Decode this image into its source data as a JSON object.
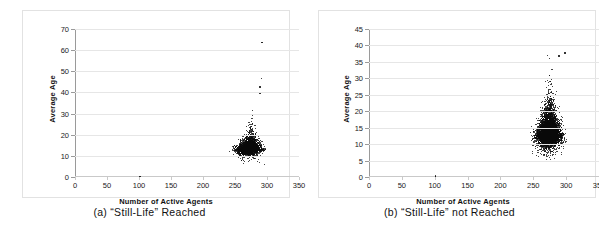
{
  "figure": {
    "panels": [
      {
        "id": "a",
        "caption": "(a) “Still-Life” Reached",
        "chart_index": 0
      },
      {
        "id": "b",
        "caption": "(b) “Still-Life” not Reached",
        "chart_index": 1
      }
    ],
    "colors": {
      "marker": "#0a0a0a",
      "gridline": "#e6e6e6",
      "axis": "#9a9a9a",
      "frame": "#e2e2e2",
      "background": "#ffffff",
      "text": "#1a1a1a"
    }
  },
  "chart_data": [
    {
      "type": "scatter",
      "title": "",
      "subtitle": "",
      "panel_label": "(a) “Still-Life” Reached",
      "xlabel": "Number of Active Agents",
      "ylabel": "Average Age",
      "xlim": [
        0,
        350
      ],
      "ylim": [
        0,
        70
      ],
      "xticks": [
        0,
        50,
        100,
        150,
        200,
        250,
        300,
        350
      ],
      "yticks": [
        0,
        10,
        20,
        30,
        40,
        50,
        60,
        70
      ],
      "xtick_labels": [
        "0",
        "50",
        "100",
        "150",
        "200",
        "250",
        "300",
        "350"
      ],
      "ytick_labels": [
        "0",
        "10",
        "20",
        "30",
        "40",
        "50",
        "60",
        "70"
      ],
      "grid": true,
      "grid_axis": "y",
      "legend": false,
      "legend_position": "none",
      "marker_size": 1,
      "marker_color": "#0a0a0a",
      "n_points_approx": 4000,
      "cluster": {
        "x_range": [
          228,
          302
        ],
        "y_range": [
          5,
          33
        ],
        "x_center": 268,
        "y_center": 13.5,
        "x_sigma": 12,
        "y_sigma": 3.2,
        "tail_direction": "upper-right",
        "description": "Dense teardrop cluster of average age vs active agents, core near (268, 13), sparse upward tail to age 33 near 285-295 agents."
      },
      "outliers": [
        {
          "x": 291,
          "y": 64
        },
        {
          "x": 290,
          "y": 47
        },
        {
          "x": 288,
          "y": 43
        },
        {
          "x": 288,
          "y": 40
        },
        {
          "x": 100,
          "y": 0.6
        }
      ]
    },
    {
      "type": "scatter",
      "title": "",
      "subtitle": "",
      "panel_label": "(b) “Still-Life” not Reached",
      "xlabel": "Number of Active Agents",
      "ylabel": "Average Age",
      "xlim": [
        0,
        350
      ],
      "ylim": [
        0,
        45
      ],
      "xticks": [
        0,
        50,
        100,
        150,
        200,
        250,
        300,
        350
      ],
      "yticks": [
        0,
        5,
        10,
        15,
        20,
        25,
        30,
        35,
        40,
        45
      ],
      "xtick_labels": [
        "0",
        "50",
        "100",
        "150",
        "200",
        "250",
        "300",
        "350"
      ],
      "ytick_labels": [
        "0",
        "5",
        "10",
        "15",
        "20",
        "25",
        "30",
        "35",
        "40",
        "45"
      ],
      "grid": true,
      "grid_axis": "y",
      "legend": false,
      "legend_position": "none",
      "marker_size": 1,
      "marker_color": "#0a0a0a",
      "n_points_approx": 8000,
      "cluster": {
        "x_range": [
          228,
          300
        ],
        "y_range": [
          5,
          38
        ],
        "x_center": 272,
        "y_center": 13,
        "x_sigma": 11,
        "y_sigma": 4.0,
        "tail_direction": "upward",
        "description": "Dense vertical teardrop cluster, core near (272, 12), narrow plume rising to age ~38 around 275-295 agents."
      },
      "outliers": [
        {
          "x": 297,
          "y": 38
        },
        {
          "x": 288,
          "y": 37
        },
        {
          "x": 100,
          "y": 0.5
        }
      ]
    }
  ]
}
